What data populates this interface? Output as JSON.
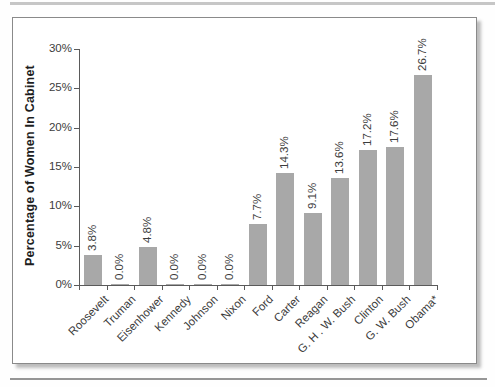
{
  "chart_data": {
    "type": "bar",
    "title": "",
    "ylabel": "Percentage of Women In Cabinet",
    "xlabel": "",
    "categories": [
      "Roosevelt",
      "Truman",
      "Eisenhower",
      "Kennedy",
      "Johnson",
      "Nixon",
      "Ford",
      "Carter",
      "Reagan",
      "G. H . W. Bush",
      "Clinton",
      "G. W. Bush",
      "Obama*"
    ],
    "values": [
      3.8,
      0.0,
      4.8,
      0.0,
      0.0,
      0.0,
      7.7,
      14.3,
      9.1,
      13.6,
      17.2,
      17.6,
      26.7
    ],
    "bar_labels": [
      "3.8%",
      "0.0%",
      "4.8%",
      "0.0%",
      "0.0%",
      "0.0%",
      "7.7%",
      "14.3%",
      "9.1%",
      "13.6%",
      "17.2%",
      "17.6%",
      "26.7%"
    ],
    "y_ticks": [
      "0%",
      "5%",
      "10%",
      "15%",
      "20%",
      "25%",
      "30%"
    ],
    "ylim": [
      0,
      30
    ],
    "y_tick_step": 5,
    "grid": "off",
    "legend": "none",
    "bar_color": "#a8a8a8",
    "axis_color": "#5a5a5a",
    "text_color": "#3c3c3c"
  }
}
